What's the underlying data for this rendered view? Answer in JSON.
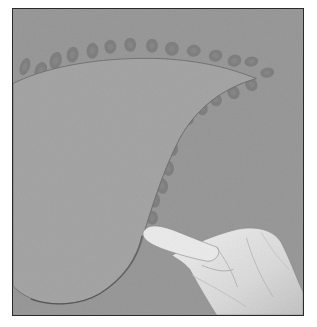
{
  "image": {
    "description": "Grayscale photograph of a gloved hand pressing a curved paper stencil against a wall; oval paint dabs form an arc along the stencil edge",
    "colors": {
      "wall": "#9a9a9a",
      "stencil": "#a6a6a6",
      "dab": "#7c7c7c",
      "glove": "#e4e4e4",
      "frame_border": "#2a2a2a",
      "page_background": "#ffffff"
    }
  },
  "dabs": [
    {
      "cx": 12,
      "cy": 58,
      "rx": 5,
      "ry": 9,
      "rot": 20
    },
    {
      "cx": 28,
      "cy": 62,
      "rx": 6,
      "ry": 9,
      "rot": 20
    },
    {
      "cx": 43,
      "cy": 52,
      "rx": 6,
      "ry": 9,
      "rot": 15
    },
    {
      "cx": 60,
      "cy": 46,
      "rx": 6,
      "ry": 8,
      "rot": 10
    },
    {
      "cx": 80,
      "cy": 42,
      "rx": 6,
      "ry": 8,
      "rot": 5
    },
    {
      "cx": 98,
      "cy": 38,
      "rx": 6,
      "ry": 7,
      "rot": 5
    },
    {
      "cx": 118,
      "cy": 36,
      "rx": 6,
      "ry": 7,
      "rot": 0
    },
    {
      "cx": 140,
      "cy": 37,
      "rx": 6,
      "ry": 7,
      "rot": 0
    },
    {
      "cx": 160,
      "cy": 40,
      "rx": 7,
      "ry": 7,
      "rot": 0
    },
    {
      "cx": 182,
      "cy": 42,
      "rx": 7,
      "ry": 6,
      "rot": -10
    },
    {
      "cx": 204,
      "cy": 47,
      "rx": 7,
      "ry": 6,
      "rot": -15
    },
    {
      "cx": 223,
      "cy": 52,
      "rx": 7,
      "ry": 6,
      "rot": -15
    },
    {
      "cx": 240,
      "cy": 53,
      "rx": 7,
      "ry": 5,
      "rot": -10
    },
    {
      "cx": 256,
      "cy": 64,
      "rx": 7,
      "ry": 5,
      "rot": -10
    },
    {
      "cx": 240,
      "cy": 76,
      "rx": 6,
      "ry": 7,
      "rot": -30
    },
    {
      "cx": 222,
      "cy": 84,
      "rx": 6,
      "ry": 7,
      "rot": -30
    },
    {
      "cx": 204,
      "cy": 91,
      "rx": 6,
      "ry": 7,
      "rot": -30
    },
    {
      "cx": 190,
      "cy": 100,
      "rx": 6,
      "ry": 7,
      "rot": -25
    },
    {
      "cx": 176,
      "cy": 110,
      "rx": 6,
      "ry": 7,
      "rot": -25
    },
    {
      "cx": 164,
      "cy": 123,
      "rx": 6,
      "ry": 7,
      "rot": -20
    },
    {
      "cx": 160,
      "cy": 140,
      "rx": 6,
      "ry": 8,
      "rot": -15
    },
    {
      "cx": 156,
      "cy": 160,
      "rx": 6,
      "ry": 8,
      "rot": -10
    },
    {
      "cx": 150,
      "cy": 178,
      "rx": 6,
      "ry": 8,
      "rot": -10
    },
    {
      "cx": 142,
      "cy": 192,
      "rx": 6,
      "ry": 8,
      "rot": -10
    },
    {
      "cx": 140,
      "cy": 210,
      "rx": 6,
      "ry": 7,
      "rot": -5
    },
    {
      "cx": 9,
      "cy": 275,
      "rx": 6,
      "ry": 10,
      "rot": 10
    },
    {
      "cx": 24,
      "cy": 284,
      "rx": 6,
      "ry": 10,
      "rot": 10
    }
  ]
}
